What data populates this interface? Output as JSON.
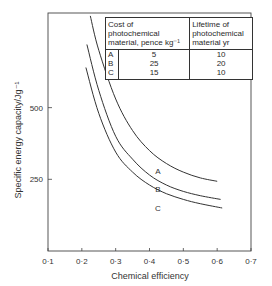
{
  "chart_data": {
    "type": "line",
    "title": "",
    "xlabel": "Chemical efficiency",
    "ylabel": "Specific energy capacity/Jg⁻¹",
    "xlim": [
      0.1,
      0.7
    ],
    "ylim": [
      0,
      830
    ],
    "x_ticks": [
      "0·1",
      "0·2",
      "0·3",
      "0·4",
      "0·5",
      "0·6",
      "0·7"
    ],
    "y_ticks": [
      "250",
      "500"
    ],
    "grid": false,
    "series": [
      {
        "name": "A",
        "x": [
          0.225,
          0.25,
          0.3,
          0.35,
          0.4,
          0.45,
          0.5,
          0.55,
          0.6
        ],
        "y": [
          820,
          700,
          530,
          420,
          350,
          305,
          275,
          255,
          243
        ]
      },
      {
        "name": "B",
        "x": [
          0.215,
          0.25,
          0.3,
          0.35,
          0.4,
          0.45,
          0.5,
          0.55,
          0.61
        ],
        "y": [
          720,
          560,
          400,
          320,
          265,
          230,
          208,
          193,
          180
        ]
      },
      {
        "name": "C",
        "x": [
          0.212,
          0.25,
          0.3,
          0.35,
          0.4,
          0.45,
          0.5,
          0.55,
          0.615
        ],
        "y": [
          640,
          480,
          345,
          275,
          230,
          200,
          180,
          165,
          150
        ]
      }
    ],
    "curve_labels": [
      {
        "text": "A",
        "x": 0.425,
        "y": 270
      },
      {
        "text": "B",
        "x": 0.425,
        "y": 205
      },
      {
        "text": "C",
        "x": 0.425,
        "y": 140
      }
    ],
    "legend_table": {
      "headers": [
        "Cost of photochemical material, pence kg⁻¹",
        "Lifetime of photochemical material yr"
      ],
      "rows": [
        {
          "label": "A",
          "cost": "5",
          "lifetime": "10"
        },
        {
          "label": "B",
          "cost": "25",
          "lifetime": "20"
        },
        {
          "label": "C",
          "cost": "15",
          "lifetime": "10"
        }
      ],
      "position": "upper right"
    }
  },
  "legend": {
    "h1a": "Cost of",
    "h1b": "photochemical",
    "h1c": "material, pence kg⁻¹",
    "h2a": "Lifetime of",
    "h2b": "photochemical",
    "h2c": "material yr",
    "rows": [
      {
        "label": "A",
        "cost": "5",
        "lifetime": "10"
      },
      {
        "label": "B",
        "cost": "25",
        "lifetime": "20"
      },
      {
        "label": "C",
        "cost": "15",
        "lifetime": "10"
      }
    ]
  }
}
